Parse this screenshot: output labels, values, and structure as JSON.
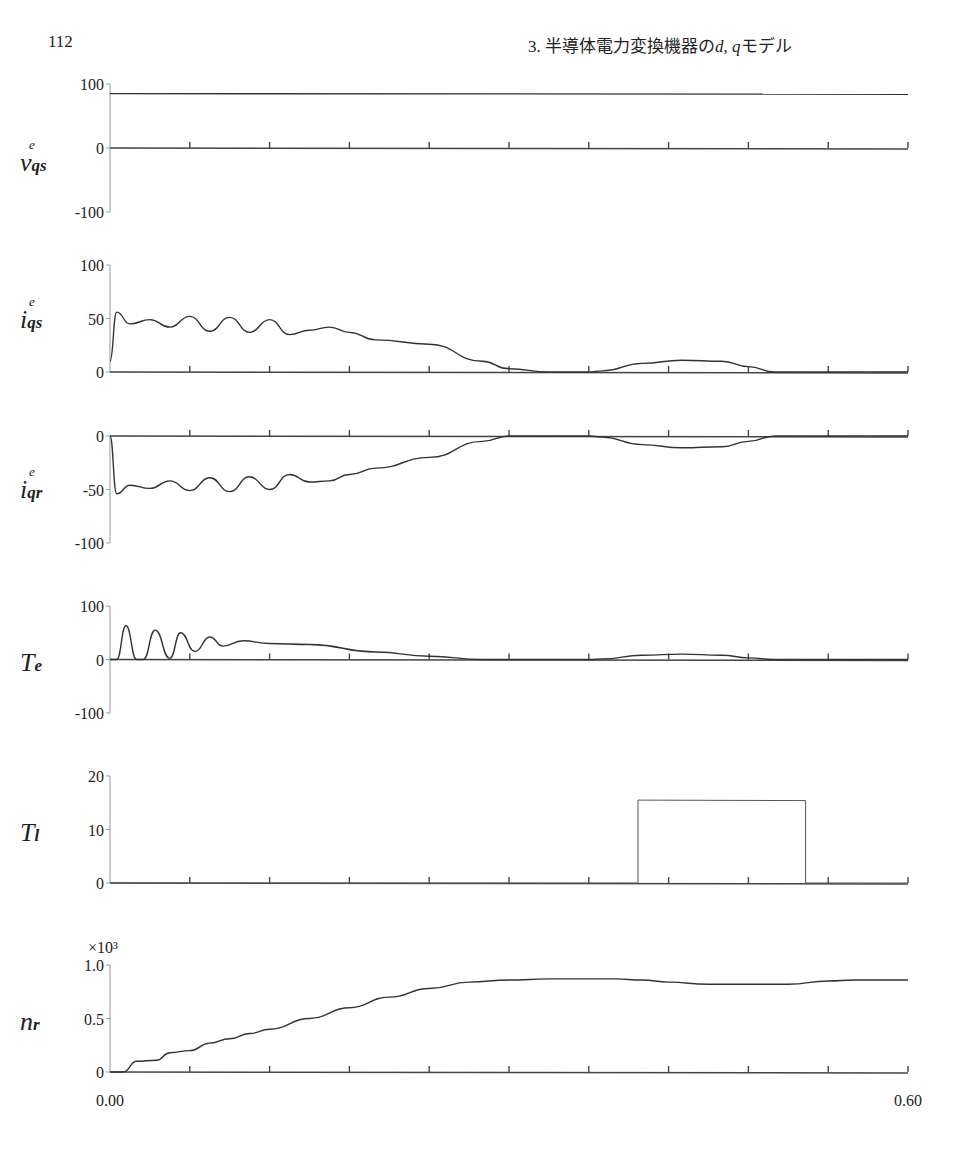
{
  "header": {
    "page_number": "112",
    "chapter_prefix": "3. 半導体電力変換機器の",
    "chapter_d": "d",
    "chapter_sep": ", ",
    "chapter_q": "q",
    "chapter_suffix": "モデル"
  },
  "x_axis": {
    "start_label": "0.00",
    "end_label": "0.60"
  },
  "chart_data": [
    {
      "type": "line",
      "signal": "v_qs^e",
      "label_main": "v",
      "label_sub": "qs",
      "label_sup": "e",
      "yticks": [
        "100",
        "0",
        "-100"
      ],
      "ylim": [
        -100,
        100
      ],
      "x": [
        0.0,
        0.6
      ],
      "values": [
        85,
        84
      ],
      "grid": false
    },
    {
      "type": "line",
      "signal": "i_qs^e",
      "label_main": "i",
      "label_sub": "qs",
      "label_sup": "e",
      "yticks": [
        "100",
        "50",
        "0"
      ],
      "ylim": [
        0,
        100
      ],
      "x": [
        0.0,
        0.005,
        0.015,
        0.03,
        0.045,
        0.06,
        0.075,
        0.09,
        0.105,
        0.12,
        0.135,
        0.15,
        0.165,
        0.18,
        0.2,
        0.24,
        0.28,
        0.3,
        0.33,
        0.36,
        0.37,
        0.4,
        0.43,
        0.46,
        0.48,
        0.5,
        0.52,
        0.6
      ],
      "values": [
        10,
        56,
        45,
        49,
        42,
        52,
        38,
        51,
        37,
        49,
        35,
        39,
        42,
        37,
        30,
        26,
        10,
        3,
        0,
        0,
        1,
        8,
        11,
        10,
        5,
        0,
        0,
        0
      ],
      "grid": false
    },
    {
      "type": "line",
      "signal": "i_qr^e",
      "label_main": "i",
      "label_sub": "qr",
      "label_sup": "e",
      "yticks": [
        "0",
        "-50",
        "-100"
      ],
      "ylim": [
        -100,
        0
      ],
      "x": [
        0.0,
        0.005,
        0.015,
        0.03,
        0.045,
        0.06,
        0.075,
        0.09,
        0.105,
        0.12,
        0.135,
        0.15,
        0.165,
        0.18,
        0.2,
        0.24,
        0.28,
        0.3,
        0.33,
        0.36,
        0.37,
        0.4,
        0.43,
        0.46,
        0.48,
        0.5,
        0.52,
        0.6
      ],
      "values": [
        0,
        -54,
        -46,
        -49,
        -42,
        -51,
        -39,
        -52,
        -38,
        -50,
        -36,
        -43,
        -42,
        -36,
        -30,
        -20,
        -5,
        0,
        0,
        0,
        -1,
        -8,
        -11,
        -10,
        -5,
        0,
        0,
        0
      ],
      "grid": false
    },
    {
      "type": "line",
      "signal": "T_e",
      "label_main": "T",
      "label_sub": "e",
      "label_sup": "",
      "yticks": [
        "100",
        "0",
        "-100"
      ],
      "ylim": [
        -100,
        100
      ],
      "x": [
        0.0,
        0.005,
        0.012,
        0.02,
        0.025,
        0.034,
        0.045,
        0.053,
        0.064,
        0.075,
        0.085,
        0.1,
        0.12,
        0.15,
        0.2,
        0.24,
        0.28,
        0.3,
        0.33,
        0.36,
        0.37,
        0.4,
        0.43,
        0.46,
        0.48,
        0.5,
        0.6
      ],
      "values": [
        0,
        0,
        63,
        0,
        0,
        55,
        2,
        50,
        15,
        42,
        25,
        35,
        30,
        28,
        14,
        6,
        0,
        0,
        0,
        0,
        1,
        8,
        10,
        8,
        3,
        0,
        0
      ],
      "grid": false
    },
    {
      "type": "line",
      "signal": "T_l",
      "label_main": "T",
      "label_sub": "l",
      "label_sup": "",
      "yticks": [
        "20",
        "10",
        "0"
      ],
      "ylim": [
        0,
        20
      ],
      "x": [
        0.0,
        0.397,
        0.397,
        0.523,
        0.523,
        0.6
      ],
      "values": [
        0,
        0,
        15.5,
        15.4,
        0,
        0
      ],
      "grid": false
    },
    {
      "type": "line",
      "signal": "n_r",
      "label_main": "n",
      "label_sub": "r",
      "label_sup": "",
      "y_multiplier": "×10³",
      "yticks": [
        "1.0",
        "0.5",
        "0"
      ],
      "ylim": [
        0,
        1.0
      ],
      "x": [
        0.0,
        0.01,
        0.02,
        0.035,
        0.045,
        0.06,
        0.075,
        0.09,
        0.105,
        0.12,
        0.15,
        0.18,
        0.21,
        0.24,
        0.27,
        0.3,
        0.33,
        0.36,
        0.38,
        0.4,
        0.42,
        0.45,
        0.48,
        0.51,
        0.54,
        0.56,
        0.6
      ],
      "values": [
        0,
        0,
        0.1,
        0.11,
        0.18,
        0.2,
        0.27,
        0.31,
        0.36,
        0.4,
        0.5,
        0.6,
        0.7,
        0.78,
        0.84,
        0.86,
        0.87,
        0.87,
        0.87,
        0.86,
        0.84,
        0.82,
        0.82,
        0.82,
        0.85,
        0.86,
        0.86
      ],
      "grid": false
    }
  ]
}
